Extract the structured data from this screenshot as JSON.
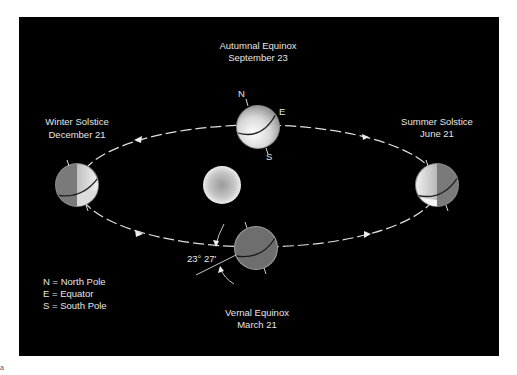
{
  "diagram": {
    "background_color": "#000000",
    "sun": {
      "label": "Sun"
    },
    "positions": [
      {
        "id": "autumnal",
        "name": "Autumnal Equinox",
        "date": "September 23"
      },
      {
        "id": "winter",
        "name": "Winter Solstice",
        "date": "December 21"
      },
      {
        "id": "summer",
        "name": "Summer Solstice",
        "date": "June 21"
      },
      {
        "id": "vernal",
        "name": "Vernal Equinox",
        "date": "March 21"
      }
    ],
    "pole_labels": {
      "north": "N",
      "equator": "E",
      "south": "S"
    },
    "tilt_label": "23° 27'",
    "legend": [
      "N = North Pole",
      "E = Equator",
      "S = South Pole"
    ],
    "corner_mark": "a"
  }
}
